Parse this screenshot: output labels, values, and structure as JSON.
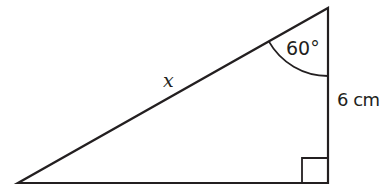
{
  "diagram": {
    "type": "right-triangle",
    "stroke_color": "#231f20",
    "background": "#ffffff",
    "vertices": {
      "bottom_left": [
        18,
        183
      ],
      "bottom_right": [
        328,
        183
      ],
      "top_right": [
        328,
        8
      ]
    },
    "labels": {
      "hypotenuse": "x",
      "angle": "60°",
      "vertical_side": "6 cm"
    },
    "right_angle_marker": true,
    "angle_arc_vertex": "top_right"
  }
}
